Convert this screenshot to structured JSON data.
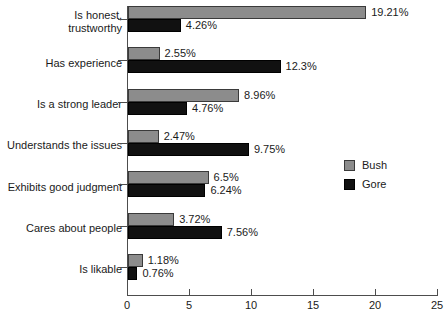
{
  "chart_data": {
    "type": "bar",
    "orientation": "horizontal",
    "title": "",
    "xlabel": "",
    "ylabel": "",
    "xlim": [
      0,
      25
    ],
    "xticks": [
      0,
      5,
      10,
      15,
      20,
      25
    ],
    "grid": false,
    "legend_position": "right",
    "categories": [
      "Is honest, trustworthy",
      "Has experience",
      "Is a strong leader",
      "Understands the issues",
      "Exhibits good judgment",
      "Cares about people",
      "Is likable"
    ],
    "category_lines": [
      [
        "Is honest,",
        "trustworthy"
      ],
      [
        "Has experience"
      ],
      [
        "Is a strong leader"
      ],
      [
        "Understands the issues"
      ],
      [
        "Exhibits good judgment"
      ],
      [
        "Cares about people"
      ],
      [
        "Is likable"
      ]
    ],
    "series": [
      {
        "name": "Bush",
        "color": "#8c8c8c",
        "values": [
          19.21,
          2.55,
          8.96,
          2.47,
          6.5,
          3.72,
          1.18
        ],
        "labels": [
          "19.21%",
          "2.55%",
          "8.96%",
          "2.47%",
          "6.5%",
          "3.72%",
          "1.18%"
        ]
      },
      {
        "name": "Gore",
        "color": "#111111",
        "values": [
          4.26,
          12.3,
          4.76,
          9.75,
          6.24,
          7.56,
          0.76
        ],
        "labels": [
          "4.26%",
          "12.3%",
          "4.76%",
          "9.75%",
          "6.24%",
          "7.56%",
          "0.76%"
        ]
      }
    ]
  },
  "legend": {
    "items": [
      {
        "label": "Bush",
        "swatch": "bush-swatch-icon"
      },
      {
        "label": "Gore",
        "swatch": "gore-swatch-icon"
      }
    ]
  },
  "axis": {
    "tick_labels": [
      "0",
      "5",
      "10",
      "15",
      "20",
      "25"
    ]
  }
}
